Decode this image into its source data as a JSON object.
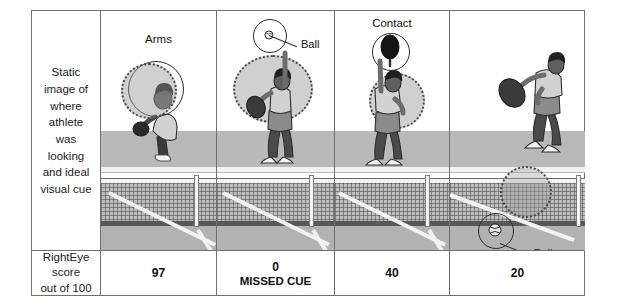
{
  "figure": {
    "row_label": "Static image of where athlete was looking and ideal visual cue",
    "score_row_label_line1": "RightEye score",
    "score_row_label_line2": "out of 100"
  },
  "panels": [
    {
      "id": "panel-1",
      "top_label": "Arms",
      "annotation": "",
      "score": "97",
      "score_note": "",
      "gaze": "solid-and-dotted-on-arms"
    },
    {
      "id": "panel-2",
      "top_label": "",
      "annotation": "Ball",
      "score": "0",
      "score_note": "MISSED CUE",
      "gaze": "dotted-on-head"
    },
    {
      "id": "panel-3",
      "top_label": "Contact",
      "annotation": "",
      "score": "40",
      "score_note": "",
      "gaze": "dotted-on-torso"
    },
    {
      "id": "panel-4",
      "top_label": "",
      "annotation": "Ball",
      "score": "20",
      "score_note": "",
      "gaze": "dotted-on-net"
    }
  ],
  "colors": {
    "border": "#6f6f6f",
    "court_back": "#b9b9b9",
    "court_front": "#b2b2b2",
    "net_dark": "#585858",
    "line_white": "#f3f3f3",
    "skin": "#6d6d6d",
    "hair": "#1f1f1f",
    "shirt": "#d7d7d7",
    "shorts": "#8b8b8b",
    "text": "#111111"
  }
}
